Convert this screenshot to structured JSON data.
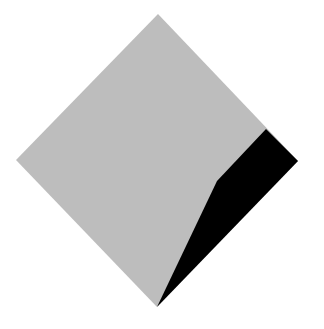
{
  "canvas": {
    "width": 324,
    "height": 329,
    "background": "#ffffff"
  },
  "shapes": {
    "diamond": {
      "fill": "#bdbdbd",
      "points": "158,14 298,161 157,307 16,160"
    },
    "shadow": {
      "fill": "#000000",
      "points": "266,129 298,161 157,307 217,181"
    }
  }
}
